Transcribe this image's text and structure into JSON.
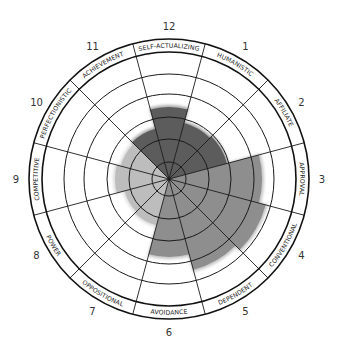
{
  "chart_data": {
    "type": "circumplex",
    "title": "",
    "center": [
      169,
      179
    ],
    "ring_radii": [
      17,
      40,
      62,
      85,
      105
    ],
    "label_ring": {
      "inner": 127,
      "outer": 140
    },
    "number_radius": 153,
    "colors": {
      "dark": "#5c5c5c",
      "medium": "#8e8e8e",
      "light": "#bdbdbd",
      "line": "#1a1a1a",
      "background": "#ffffff"
    },
    "segments": [
      {
        "position": 12,
        "label": "SELF-ACTUALIZING",
        "value_radius": 72,
        "shade": "dark"
      },
      {
        "position": 1,
        "label": "HUMANISTIC",
        "value_radius": 58,
        "shade": "dark"
      },
      {
        "position": 2,
        "label": "AFFILIATE",
        "value_radius": 60,
        "shade": "dark"
      },
      {
        "position": 3,
        "label": "APPROVAL",
        "value_radius": 93,
        "shade": "medium"
      },
      {
        "position": 4,
        "label": "CONVENTIONAL",
        "value_radius": 100,
        "shade": "medium"
      },
      {
        "position": 5,
        "label": "DEPENDENT",
        "value_radius": 94,
        "shade": "medium"
      },
      {
        "position": 6,
        "label": "AVOIDANCE",
        "value_radius": 78,
        "shade": "medium"
      },
      {
        "position": 7,
        "label": "OPPOSITIONAL",
        "value_radius": 48,
        "shade": "light"
      },
      {
        "position": 8,
        "label": "POWER",
        "value_radius": 46,
        "shade": "light"
      },
      {
        "position": 9,
        "label": "COMPETITIVE",
        "value_radius": 54,
        "shade": "light"
      },
      {
        "position": 10,
        "label": "PERFECTIONISTIC",
        "value_radius": 50,
        "shade": "light"
      },
      {
        "position": 11,
        "label": "ACHIEVEMENT",
        "value_radius": 52,
        "shade": "dark"
      }
    ],
    "legend": null,
    "grid": true
  }
}
